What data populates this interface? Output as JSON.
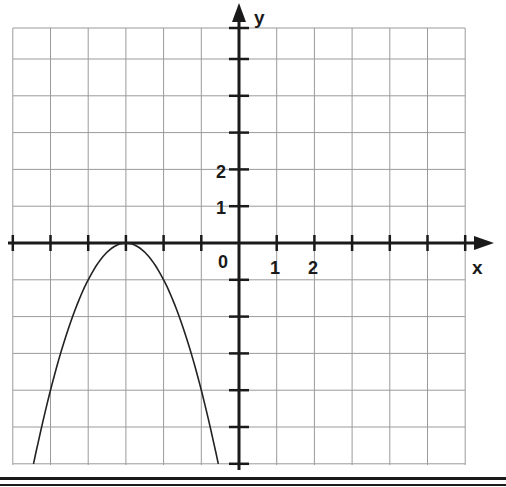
{
  "chart_data": {
    "type": "line",
    "title": "",
    "xlabel": "x",
    "ylabel": "y",
    "xlim": [
      -6,
      6
    ],
    "ylim": [
      -6,
      6
    ],
    "grid": true,
    "x_tick_labels": [
      {
        "value": 0,
        "label": "0"
      },
      {
        "value": 1,
        "label": "1"
      },
      {
        "value": 2,
        "label": "2"
      }
    ],
    "y_tick_labels": [
      {
        "value": 1,
        "label": "1"
      },
      {
        "value": 2,
        "label": "2"
      }
    ],
    "series": [
      {
        "name": "parabola y = -(x+3)^2",
        "vertex": [
          -3,
          0
        ],
        "x": [
          -5.45,
          -5,
          -4,
          -3,
          -2,
          -1,
          -0.55
        ],
        "values": [
          -6,
          -4,
          -1,
          0,
          -1,
          -4,
          -6
        ]
      }
    ]
  },
  "labels": {
    "x_axis": "x",
    "y_axis": "y",
    "origin": "0",
    "x1": "1",
    "x2": "2",
    "y1": "1",
    "y2": "2"
  }
}
